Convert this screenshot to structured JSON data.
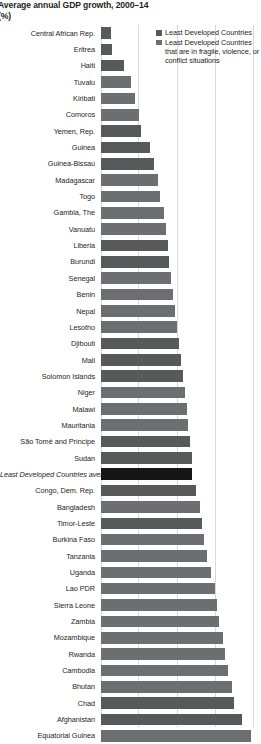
{
  "title": {
    "main": "Average annual GDP growth, 2000–14",
    "units": "(%)"
  },
  "legend": {
    "position": "top-right",
    "items": [
      {
        "label": "Least Developed Countries",
        "color": "#58595b",
        "key": "ldc"
      },
      {
        "label": "Least Developed Countries that are in fragile, violence, or conflict situations",
        "color": "#6d6e71",
        "key": "fragile"
      }
    ]
  },
  "axis": {
    "ticks": [
      0,
      2,
      4,
      6,
      8
    ],
    "grid": true,
    "gridline_positions_px": [
      101,
      138,
      177,
      215,
      253
    ],
    "px_per_unit": 19.0,
    "origin_px": 101
  },
  "chart_data": {
    "type": "bar",
    "orientation": "horizontal",
    "title": "Average annual GDP growth, 2000–14",
    "subtitle": "(%)",
    "xlabel": "(%)",
    "ylabel": "",
    "xlim": [
      0,
      8.4
    ],
    "grid": true,
    "legend_position": "top-right",
    "legend": [
      "Least Developed Countries",
      "Least Developed Countries that are in fragile, violence, or conflict situations"
    ],
    "categories": [
      "Central African Rep.",
      "Eritrea",
      "Haiti",
      "Tuvalu",
      "Kiribati",
      "Comoros",
      "Yemen, Rep.",
      "Guinea",
      "Guinea-Bissau",
      "Madagascar",
      "Togo",
      "Gambia, The",
      "Vanuatu",
      "Liberia",
      "Burundi",
      "Senegal",
      "Benin",
      "Nepal",
      "Lesotho",
      "Djibouti",
      "Mali",
      "Solomon Islands",
      "Niger",
      "Malawi",
      "Mauritania",
      "São Tomé and Príncipe",
      "Sudan",
      "Least Developed Countries average",
      "Congo, Dem. Rep.",
      "Bangladesh",
      "Timor-Leste",
      "Burkina Faso",
      "Tanzania",
      "Uganda",
      "Lao PDR",
      "Sierra Leone",
      "Zambia",
      "Mozambique",
      "Rwanda",
      "Cambodia",
      "Bhutan",
      "Chad",
      "Afghanistan",
      "Equatorial Guinea"
    ],
    "values": [
      0.5,
      0.6,
      1.2,
      1.6,
      1.8,
      2.0,
      2.1,
      2.6,
      2.8,
      3.0,
      3.1,
      3.3,
      3.4,
      3.5,
      3.6,
      3.7,
      3.8,
      3.9,
      4.0,
      4.1,
      4.2,
      4.3,
      4.4,
      4.5,
      4.6,
      4.7,
      4.8,
      4.8,
      5.0,
      5.2,
      5.3,
      5.4,
      5.6,
      5.8,
      6.0,
      6.1,
      6.2,
      6.4,
      6.5,
      6.7,
      6.9,
      7.0,
      7.4,
      7.9
    ],
    "series_key": [
      "fragile",
      "fragile",
      "fragile",
      "ldc",
      "ldc",
      "ldc",
      "fragile",
      "fragile",
      "fragile",
      "ldc",
      "ldc",
      "ldc",
      "ldc",
      "fragile",
      "fragile",
      "ldc",
      "ldc",
      "ldc",
      "ldc",
      "fragile",
      "fragile",
      "fragile",
      "ldc",
      "ldc",
      "ldc",
      "fragile",
      "fragile",
      "average",
      "fragile",
      "ldc",
      "fragile",
      "ldc",
      "ldc",
      "ldc",
      "ldc",
      "ldc",
      "ldc",
      "ldc",
      "ldc",
      "ldc",
      "ldc",
      "fragile",
      "fragile",
      "ldc"
    ]
  }
}
